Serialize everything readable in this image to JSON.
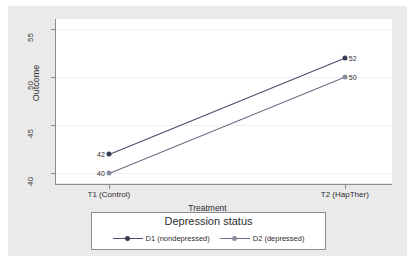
{
  "chart_data": {
    "type": "line",
    "title": "",
    "xlabel": "Treatment",
    "ylabel": "Outcome",
    "categories": [
      "T1 (Control)",
      "T2 (HapTher)"
    ],
    "ylim": [
      39,
      56
    ],
    "yticks": [
      40,
      45,
      50,
      55
    ],
    "grid": true,
    "legend_title": "Depression status",
    "legend_position": "bottom",
    "series": [
      {
        "name": "D1 (nondepressed)",
        "values": [
          42,
          52
        ],
        "point_labels": [
          "42",
          "52"
        ],
        "color": "#3b3b55",
        "marker": "filled-circle"
      },
      {
        "name": "D2 (depressed)",
        "values": [
          40,
          50
        ],
        "point_labels": [
          "40",
          "50"
        ],
        "color": "#8a8aa0",
        "marker": "light-circle"
      }
    ]
  },
  "axes": {
    "y_title": "Outcome",
    "x_title": "Treatment",
    "y_tick_labels": [
      "40",
      "45",
      "50",
      "55"
    ],
    "x_tick_labels": [
      "T1 (Control)",
      "T2 (HapTher)"
    ]
  },
  "legend": {
    "title": "Depression status",
    "entries": [
      {
        "label": "D1 (nondepressed)"
      },
      {
        "label": "D2 (depressed)"
      }
    ]
  },
  "point_labels": {
    "s1_left": "42",
    "s1_right": "52",
    "s2_left": "40",
    "s2_right": "50"
  },
  "colors": {
    "canvas": "#eaeaea",
    "plot_background": "#ffffff",
    "axis": "#8c8c8c",
    "gridline": "#f0f0f0",
    "series1": "#3b3b55",
    "series2": "#8a8aa0"
  }
}
